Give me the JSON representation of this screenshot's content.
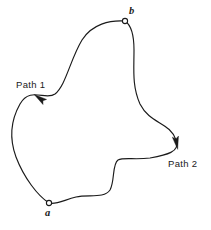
{
  "figure": {
    "type": "closed-curve-diagram",
    "background_color": "#ffffff",
    "stroke_color": "#1a1a1a",
    "width": 211,
    "height": 230
  },
  "labels": {
    "path1": "Path 1",
    "path2": "Path 2",
    "point_a": "a",
    "point_b": "b"
  },
  "points": [
    {
      "name": "a",
      "label": "a",
      "x": 49,
      "y": 203,
      "marker": "open-circle"
    },
    {
      "name": "b",
      "label": "b",
      "x": 125,
      "y": 21,
      "marker": "open-circle"
    }
  ],
  "arrows": [
    {
      "name": "path1-arrow",
      "x": 42,
      "y": 100,
      "direction": "up-right",
      "angle_deg": -55
    },
    {
      "name": "path2-arrow",
      "x": 176,
      "y": 140,
      "direction": "down",
      "angle_deg": 80
    }
  ],
  "geometry": {
    "path1": "M 49 203 C 38 196 24 178 16 157 C 9 138 11 120 20 104 C 30 86 46 101 55 94 C 66 85 70 60 82 40 C 92 24 110 20 125 21",
    "path2": "M 125 21 C 131 25 134 36 134 50 C 134 70 132 86 140 104 C 150 124 170 122 176 140 C 181 152 166 155 150 158 C 134 160 124 157 118 160 C 112 164 115 181 110 190 C 104 199 88 194 76 197 C 64 200 56 205 49 203"
  }
}
